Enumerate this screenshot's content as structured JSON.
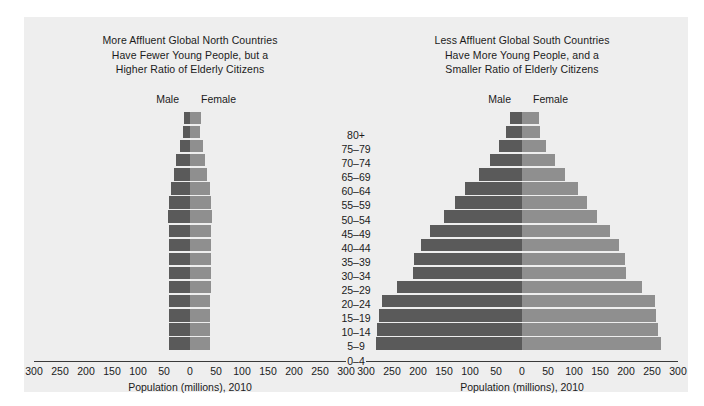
{
  "figure": {
    "background_color": "#eeeeee",
    "male_color": "#5a5a5a",
    "female_color": "#8f8f8f"
  },
  "age_groups": [
    "80+",
    "75–79",
    "70–74",
    "65–69",
    "60–64",
    "55–59",
    "50–54",
    "45–49",
    "40–44",
    "35–39",
    "30–34",
    "25–29",
    "20–24",
    "15–19",
    "10–14",
    "5–9",
    "0–4"
  ],
  "legend": {
    "male_label": "Male",
    "female_label": "Female"
  },
  "axis": {
    "ticks": [
      "300",
      "250",
      "200",
      "150",
      "100",
      "50",
      "0",
      "50",
      "100",
      "150",
      "200",
      "250",
      "300"
    ],
    "label": "Population (millions), 2010",
    "min": -300,
    "max": 300
  },
  "chart_data": [
    {
      "type": "bar",
      "id": "global-north",
      "title_lines": [
        "More Affluent Global North Countries",
        "Have Fewer Young People, but a",
        "Higher Ratio of Elderly Citizens"
      ],
      "orientation": "population-pyramid",
      "categories": [
        "80+",
        "75–79",
        "70–74",
        "65–69",
        "60–64",
        "55–59",
        "50–54",
        "45–49",
        "40–44",
        "35–39",
        "30–34",
        "25–29",
        "20–24",
        "15–19",
        "10–14",
        "5–9",
        "0–4"
      ],
      "series": [
        {
          "name": "Male",
          "side": "left",
          "values": [
            11,
            14,
            20,
            26,
            31,
            36,
            40,
            42,
            41,
            40,
            40,
            40,
            40,
            41,
            41,
            41,
            40
          ]
        },
        {
          "name": "Female",
          "side": "right",
          "values": [
            22,
            20,
            25,
            29,
            33,
            38,
            41,
            43,
            41,
            40,
            40,
            40,
            40,
            39,
            39,
            39,
            38
          ]
        }
      ],
      "xlabel": "Population (millions), 2010",
      "ylabel": "",
      "xlim": [
        -300,
        300
      ],
      "grid": false,
      "legend_position": "top-center"
    },
    {
      "type": "bar",
      "id": "global-south",
      "title_lines": [
        "Less Affluent Global South Countries",
        "Have More Young People, and a",
        "Smaller Ratio of Elderly Citizens"
      ],
      "orientation": "population-pyramid",
      "categories": [
        "80+",
        "75–79",
        "70–74",
        "65–69",
        "60–64",
        "55–59",
        "50–54",
        "45–49",
        "40–44",
        "35–39",
        "30–34",
        "25–29",
        "20–24",
        "15–19",
        "10–14",
        "5–9",
        "0–4"
      ],
      "series": [
        {
          "name": "Male",
          "side": "left",
          "values": [
            24,
            30,
            45,
            62,
            82,
            110,
            128,
            150,
            177,
            195,
            208,
            210,
            240,
            270,
            275,
            278,
            280
          ]
        },
        {
          "name": "Female",
          "side": "right",
          "values": [
            32,
            34,
            47,
            63,
            83,
            108,
            125,
            145,
            170,
            187,
            198,
            200,
            230,
            255,
            258,
            262,
            268
          ]
        }
      ],
      "xlabel": "Population (millions), 2010",
      "ylabel": "",
      "xlim": [
        -300,
        300
      ],
      "grid": false,
      "legend_position": "top-center"
    }
  ]
}
